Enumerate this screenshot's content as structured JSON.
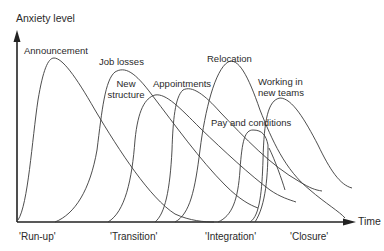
{
  "axes": {
    "y_label": "Anxiety level",
    "x_label": "Time"
  },
  "phases": [
    "'Run-up'",
    "'Transition'",
    "'Integration'",
    "'Closure'"
  ],
  "curves": [
    {
      "label": "Announcement"
    },
    {
      "label": "Job losses"
    },
    {
      "label_line1": "New",
      "label_line2": "structure"
    },
    {
      "label": "Appointments"
    },
    {
      "label": "Relocation"
    },
    {
      "label": "Pay and conditions"
    },
    {
      "label_line1": "Working in",
      "label_line2": "new teams"
    }
  ],
  "colors": {
    "line": "#3a3a3a",
    "text": "#2a2a2a",
    "background": "#ffffff"
  }
}
